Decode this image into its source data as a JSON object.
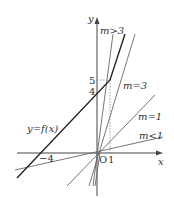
{
  "diagram": {
    "type": "function-graph",
    "axes": {
      "x_label": "x",
      "y_label": "y",
      "origin_label": "O"
    },
    "tick_labels": {
      "x_neg4": "−4",
      "x_1": "1",
      "y_4": "4",
      "y_5": "5"
    },
    "curve_label": "y=f(x)",
    "line_labels": {
      "m_gt_3": "m>3",
      "m_eq_3": "m=3",
      "m_eq_1": "m=1",
      "m_lt_1": "m<1"
    },
    "colors": {
      "axis": "#444444",
      "function": "#222222",
      "lines": "#666666",
      "dashed": "#888888"
    }
  }
}
